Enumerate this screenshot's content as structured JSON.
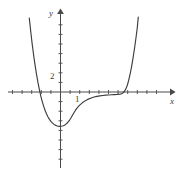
{
  "figure": {
    "name": "cartesian-graph-of-polynomial",
    "background_color": "#ffffff",
    "axis_color": "#4a4a4a",
    "curve_color": "#3c3c3c",
    "width": 186,
    "height": 173
  },
  "axes": {
    "y_axis_label": "y",
    "x_axis_label": "x",
    "origin_px": {
      "x": 60.5,
      "y": 92.0
    },
    "unit_px": 9.6,
    "x_axis_start_px": 8,
    "x_axis_end_px": 170,
    "y_axis_top_px": 14,
    "y_axis_bottom_px": 168,
    "tick_length_px": 4
  },
  "tick_labels": {
    "y_two": "2",
    "x_one": "1"
  },
  "chart_data": {
    "type": "line",
    "title": "",
    "xlabel": "x",
    "ylabel": "y",
    "grid": false,
    "legend": null,
    "xlim": [
      -5.5,
      11.4
    ],
    "ylim": [
      -8.1,
      8.1
    ],
    "xticks": [
      -5,
      -4,
      -3,
      -2,
      -1,
      1,
      2,
      3,
      4,
      5,
      6,
      7,
      8,
      9,
      10,
      11
    ],
    "yticks": [
      -8,
      -7,
      -6,
      -5,
      -4,
      -3,
      -2,
      -1,
      1,
      2,
      3,
      4,
      5,
      6,
      7,
      8
    ],
    "labeled_xticks": [
      {
        "value": 1,
        "label": "1"
      }
    ],
    "labeled_yticks": [
      {
        "value": 2,
        "label": "2"
      }
    ],
    "annotations": [],
    "series": [
      {
        "name": "curve",
        "color": "#3c3c3c",
        "x": [
          -3.25,
          -3.1,
          -2.95,
          -2.8,
          -2.65,
          -2.5,
          -2.35,
          -2.2,
          -2.05,
          -1.9,
          -1.75,
          -1.6,
          -1.45,
          -1.3,
          -1.15,
          -1.0,
          -0.85,
          -0.7,
          -0.55,
          -0.4,
          -0.25,
          -0.1,
          0.05,
          0.2,
          0.35,
          0.5,
          0.65,
          0.8,
          0.95,
          1.1,
          1.25,
          1.4,
          1.55,
          1.7,
          1.85,
          2.0,
          2.3,
          2.6,
          2.9,
          3.2,
          3.5,
          3.8,
          4.1,
          4.4,
          4.7,
          5.0,
          5.3,
          5.6,
          5.9,
          6.2,
          6.35,
          6.5,
          6.65,
          6.8,
          6.95,
          7.1,
          7.25,
          7.4,
          7.55,
          7.7,
          7.85,
          8.0,
          8.1
        ],
        "y": [
          7.7,
          6.3,
          5.0,
          3.85,
          2.8,
          1.85,
          1.0,
          0.25,
          -0.42,
          -1.0,
          -1.5,
          -1.93,
          -2.3,
          -2.6,
          -2.85,
          -3.05,
          -3.22,
          -3.35,
          -3.45,
          -3.52,
          -3.56,
          -3.58,
          -3.57,
          -3.54,
          -3.48,
          -3.4,
          -3.28,
          -3.12,
          -2.92,
          -2.68,
          -2.42,
          -2.16,
          -1.92,
          -1.7,
          -1.52,
          -1.36,
          -1.1,
          -0.9,
          -0.74,
          -0.62,
          -0.52,
          -0.45,
          -0.4,
          -0.36,
          -0.33,
          -0.31,
          -0.29,
          -0.27,
          -0.25,
          -0.22,
          -0.18,
          -0.1,
          0.05,
          0.3,
          0.68,
          1.2,
          1.85,
          2.62,
          3.5,
          4.48,
          5.55,
          6.72,
          7.8
        ]
      }
    ]
  }
}
